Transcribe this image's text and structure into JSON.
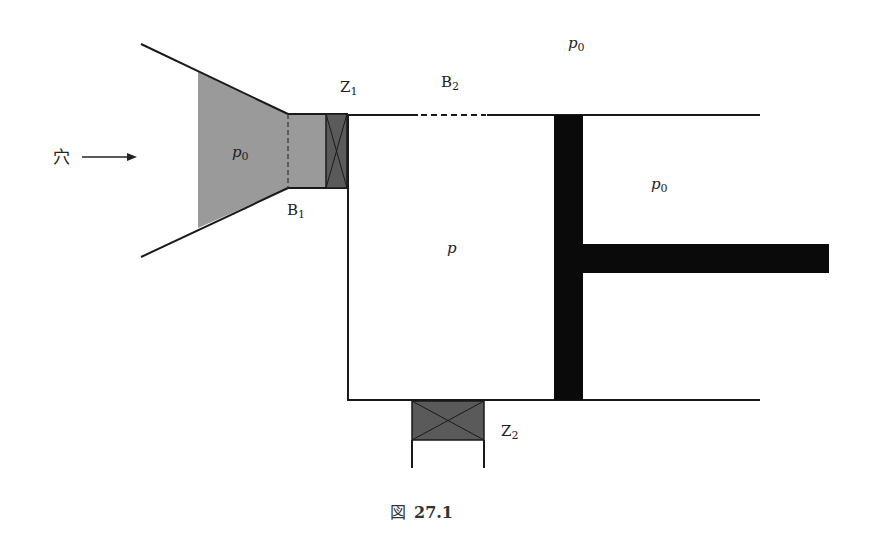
{
  "colors": {
    "line": "#1a1a1a",
    "gas_fill": "#9a9a9a",
    "valve_fill": "#5a5a5a",
    "piston": "#0a0a0a",
    "background": "#ffffff"
  },
  "labels": {
    "hole": "穴",
    "p0_inlet": "p",
    "p0_inlet_sub": "0",
    "p0_top": "p",
    "p0_top_sub": "0",
    "p0_right": "p",
    "p0_right_sub": "0",
    "p_chamber": "p",
    "z1": "Z",
    "z1_sub": "1",
    "z2": "Z",
    "z2_sub": "2",
    "b1": "B",
    "b1_sub": "1",
    "b2": "B",
    "b2_sub": "2"
  },
  "caption": {
    "prefix": "図",
    "number": "27.1"
  }
}
